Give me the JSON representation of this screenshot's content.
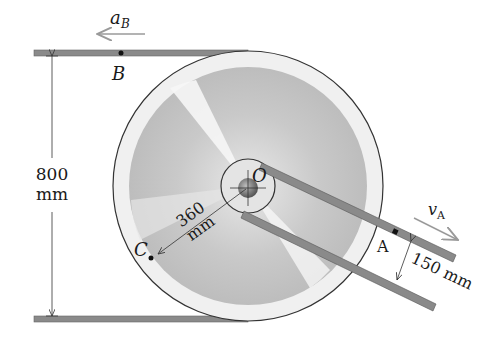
{
  "diagram": {
    "labels": {
      "point_B": "B",
      "accel_B_main": "a",
      "accel_B_sub": "B",
      "point_O": "O",
      "point_C": "C",
      "point_A": "A",
      "vel_A_main": "v",
      "vel_A_sub": "A",
      "dim_height_value": "800",
      "dim_height_unit": "mm",
      "dim_radius_value": "360",
      "dim_radius_unit": "mm",
      "dim_gap": "150 mm"
    },
    "colors": {
      "strap": "#8a8a8a",
      "outline": "#333333",
      "arrow_gray": "#9a9a9a",
      "wheel_face": "#cfcfcf"
    }
  }
}
